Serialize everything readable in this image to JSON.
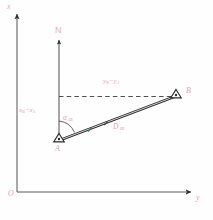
{
  "figure": {
    "background_color": "#fefefe",
    "label_color": "#e8a0b4",
    "line_color": "#3a3a3a"
  },
  "axes": {
    "vertical": {
      "name": "x-axis",
      "label": "x",
      "arrow_direction": "up",
      "x": 17,
      "top_y": 12,
      "bottom_y": 192
    },
    "horizontal": {
      "name": "y-axis",
      "label": "y",
      "arrow_direction": "right",
      "y": 192,
      "left_x": 17,
      "right_x": 194
    },
    "origin": {
      "label": "O",
      "x": 17,
      "y": 192
    }
  },
  "north": {
    "label": "N",
    "line_x": 59,
    "top_y": 38,
    "bottom_y": 140,
    "label_x": 55,
    "label_y": 27
  },
  "points": [
    {
      "name": "point-a",
      "label": "A",
      "marker": "triangle",
      "x": 59,
      "y": 140,
      "label_x": 55,
      "label_y": 147
    },
    {
      "name": "point-b",
      "label": "B",
      "marker": "triangle",
      "x": 176,
      "y": 96,
      "label_x": 186,
      "label_y": 89
    }
  ],
  "measurements": {
    "delta_x": {
      "name": "delta-x-label",
      "base": "x",
      "sub1": "B",
      "minus": "−",
      "base2": "x",
      "sub2": "A",
      "text": "xᴮ − xᴬ",
      "x": 19,
      "y": 110
    },
    "delta_y": {
      "name": "delta-y-label",
      "base": "y",
      "sub1": "B",
      "minus": "−",
      "base2": "y",
      "sub2": "A",
      "text": "yᴮ − yᴬ",
      "x": 103,
      "y": 81
    },
    "azimuth": {
      "name": "azimuth-angle-label",
      "symbol": "α",
      "sub": "AB",
      "x": 63,
      "y": 117
    },
    "distance": {
      "name": "distance-label",
      "symbol": "D",
      "sub": "AB",
      "x": 113,
      "y": 126
    }
  },
  "dashed_line": {
    "name": "horizontal-projection-line",
    "from_x": 59,
    "to_x": 176,
    "y": 96
  },
  "caption": {
    "text": ""
  }
}
